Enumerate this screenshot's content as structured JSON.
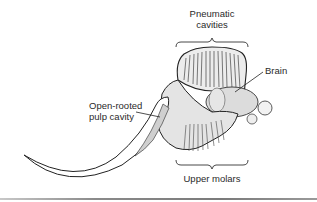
{
  "figure": {
    "labels": {
      "pneumatic_line1": "Pneumatic",
      "pneumatic_line2": "cavities",
      "brain": "Brain",
      "pulp_line1": "Open-rooted",
      "pulp_line2": "pulp cavity",
      "molars": "Upper molars"
    },
    "colors": {
      "ink": "#2a2a2a",
      "stipple": "#d8d8d8",
      "tusk_pulp": "#cfcfcf",
      "background": "#ffffff"
    }
  }
}
